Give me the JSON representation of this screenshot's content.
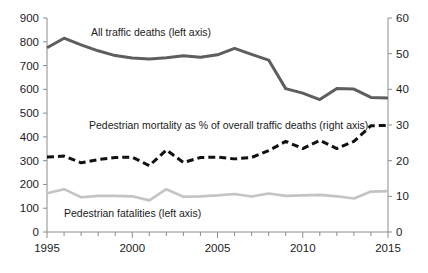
{
  "chart_data": {
    "type": "line",
    "title": "",
    "xlabel": "",
    "ylabel": "",
    "x": [
      1995,
      1996,
      1997,
      1998,
      1999,
      2000,
      2001,
      2002,
      2003,
      2004,
      2005,
      2006,
      2007,
      2008,
      2009,
      2010,
      2011,
      2012,
      2013,
      2014,
      2015
    ],
    "xlim": [
      1995,
      2015
    ],
    "xticks": [
      1995,
      1996,
      1997,
      1998,
      1999,
      2000,
      2001,
      2002,
      2003,
      2004,
      2005,
      2006,
      2007,
      2008,
      2009,
      2010,
      2011,
      2012,
      2013,
      2014,
      2015
    ],
    "xtick_labels": [
      "1995",
      "",
      "",
      "",
      "",
      "2000",
      "",
      "",
      "",
      "",
      "2005",
      "",
      "",
      "",
      "",
      "2010",
      "",
      "",
      "",
      "",
      "2015"
    ],
    "left_axis": {
      "ylim": [
        0,
        900
      ],
      "yticks": [
        0,
        100,
        200,
        300,
        400,
        500,
        600,
        700,
        800,
        900
      ],
      "ytick_labels": [
        "0",
        "100",
        "200",
        "300",
        "400",
        "500",
        "600",
        "700",
        "800",
        "900"
      ]
    },
    "right_axis": {
      "ylim": [
        0,
        60
      ],
      "yticks": [
        0,
        10,
        20,
        30,
        40,
        50,
        60
      ],
      "ytick_labels": [
        "0",
        "10",
        "20",
        "30",
        "40",
        "50",
        "60"
      ]
    },
    "grid": false,
    "legend_position": "inline-annotations",
    "series": [
      {
        "name": "All traffic deaths (left axis)",
        "axis": "left",
        "style": "solid",
        "color": "#5e5e5e",
        "width": 3,
        "values": [
          775,
          815,
          787,
          762,
          742,
          732,
          728,
          733,
          741,
          735,
          745,
          772,
          747,
          723,
          603,
          584,
          557,
          604,
          601,
          566,
          564
        ]
      },
      {
        "name": "Pedestrian mortality as % of overall traffic deaths (right axis)",
        "axis": "right",
        "style": "dashed",
        "color": "#111111",
        "width": 3,
        "values": [
          21.0,
          21.3,
          19.4,
          20.3,
          20.9,
          21.0,
          18.6,
          23.0,
          19.5,
          20.9,
          21.0,
          20.5,
          20.9,
          22.8,
          25.4,
          23.4,
          25.7,
          23.4,
          25.4,
          29.8,
          29.9
        ]
      },
      {
        "name": "Pedestrian fatalities (left axis)",
        "axis": "left",
        "style": "solid",
        "color": "#c4c4c4",
        "width": 2.6,
        "values": [
          163,
          180,
          146,
          152,
          152,
          150,
          133,
          180,
          148,
          150,
          154,
          160,
          149,
          162,
          152,
          154,
          156,
          150,
          141,
          170,
          172
        ]
      }
    ],
    "annotations": [
      {
        "text": "All traffic deaths (left axis)",
        "x": 91,
        "y": 36
      },
      {
        "text": "Pedestrian mortality as % of overall traffic deaths (right axis)",
        "x": 89,
        "y": 129
      },
      {
        "text": "Pedestrian fatalities (left axis)",
        "x": 64,
        "y": 217
      }
    ]
  }
}
